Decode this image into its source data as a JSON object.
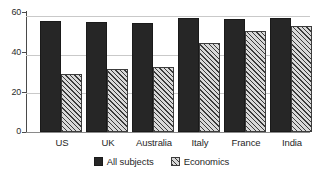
{
  "chart_data": {
    "type": "bar",
    "title": "",
    "subtitle": "",
    "xlabel": "",
    "ylabel": "",
    "categories": [
      "US",
      "UK",
      "Australia",
      "Italy",
      "France",
      "India"
    ],
    "series": [
      {
        "name": "All subjects",
        "style": "solid",
        "color": "#262626",
        "values": [
          57.5,
          57,
          56.5,
          59,
          58.5,
          59
        ]
      },
      {
        "name": "Economics",
        "style": "hatched",
        "color": "#d8d8d8",
        "values": [
          30,
          32.5,
          33.5,
          46,
          52,
          55
        ]
      }
    ],
    "ylim": [
      0,
      62
    ],
    "yticks": [
      0,
      20,
      40,
      60
    ],
    "ytick_labels": [
      "0",
      "20",
      "40",
      "60"
    ],
    "grid": true,
    "grid_axis": "y",
    "legend_position": "bottom"
  },
  "legend": {
    "items": [
      {
        "label": "All subjects",
        "swatch": "solid-swatch-icon"
      },
      {
        "label": "Economics",
        "swatch": "hatched-swatch-icon"
      }
    ]
  }
}
